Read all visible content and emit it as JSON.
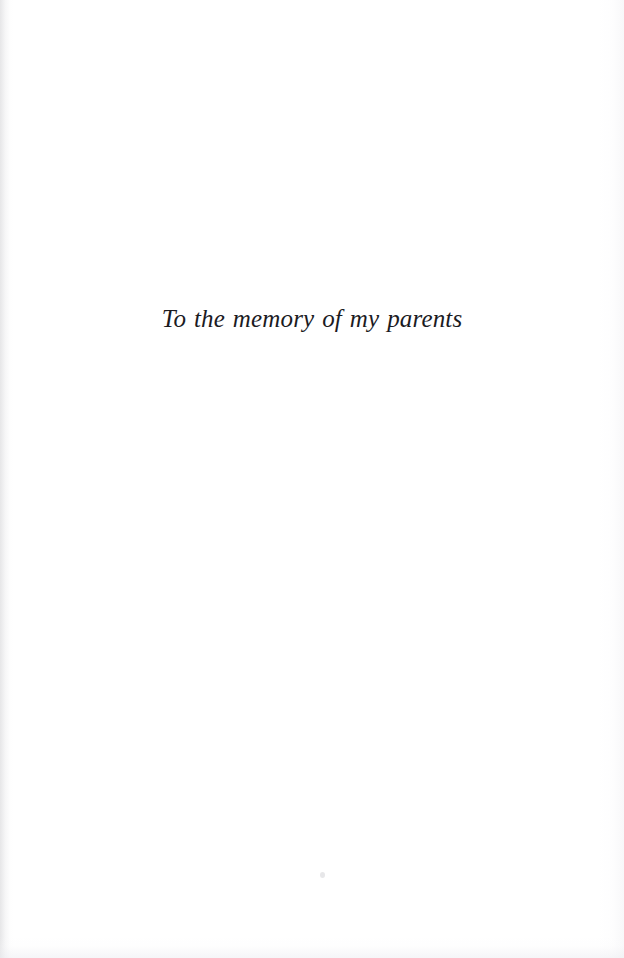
{
  "page": {
    "kind": "book-dedication-page",
    "background_color": "#ffffff",
    "text_color": "#1b1b1f"
  },
  "dedication": {
    "text": "To the memory of my parents"
  },
  "artifacts": {
    "left_edge_band": "faint-gray-scan-band",
    "right_edge_band": "faint-gray-scan-band",
    "bottom_edge_band": "faint-gray-scan-smudge",
    "speck": "faint-gray-speck"
  }
}
